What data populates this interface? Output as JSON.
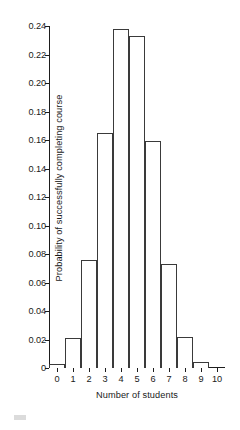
{
  "chart_data": {
    "type": "bar",
    "title": "",
    "subtitle": "",
    "xlabel": "Number of students",
    "ylabel": "Probability of successfully completing course",
    "categories": [
      "0",
      "1",
      "2",
      "3",
      "4",
      "5",
      "6",
      "7",
      "8",
      "9",
      "10"
    ],
    "values": [
      0.003,
      0.021,
      0.076,
      0.165,
      0.238,
      0.233,
      0.159,
      0.073,
      0.022,
      0.004,
      0.0
    ],
    "xlim": [
      -0.5,
      10.5
    ],
    "ylim": [
      0,
      0.24
    ],
    "xticks": [
      "0",
      "1",
      "2",
      "3",
      "4",
      "5",
      "6",
      "7",
      "8",
      "9",
      "10"
    ],
    "yticks": [
      "0",
      "0.02",
      "0.04",
      "0.06",
      "0.08",
      "0.10",
      "0.12",
      "0.14",
      "0.16",
      "0.18",
      "0.20",
      "0.22",
      "0.24"
    ],
    "ytick_values": [
      0,
      0.02,
      0.04,
      0.06,
      0.08,
      0.1,
      0.12,
      0.14,
      0.16,
      0.18,
      0.2,
      0.22,
      0.24
    ],
    "grid": false,
    "legend": false,
    "legend_position": "none",
    "bar_fill": "#ffffff",
    "bar_edge_color": "#3a3a3a",
    "axis_color": "#1d1d1d",
    "background": "#ffffff",
    "bar_width": 1
  }
}
